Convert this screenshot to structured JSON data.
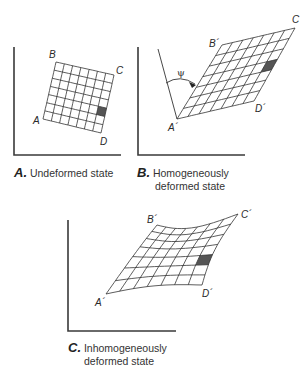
{
  "panels": [
    {
      "id": "A",
      "letter": "A.",
      "caption_line1": "Undeformed state",
      "caption_line2": "",
      "points": {
        "A": "A",
        "B": "B",
        "C": "C",
        "D": "D"
      },
      "grid": {
        "rows": 7,
        "cols": 7,
        "corners": {
          "A": [
            43,
            119
          ],
          "B": [
            56,
            62
          ],
          "C": [
            114,
            75
          ],
          "D": [
            101,
            133
          ]
        },
        "shaded_cell": [
          6,
          2
        ]
      }
    },
    {
      "id": "B",
      "letter": "B.",
      "caption_line1": "Homogeneously",
      "caption_line2": "deformed state",
      "points": {
        "A": "A´",
        "B": "B´",
        "C": "C",
        "D": "D´"
      },
      "angle_label": "ψ",
      "grid": {
        "rows": 7,
        "cols": 7,
        "corners": {
          "A": [
            177,
            119
          ],
          "B": [
            222,
            45
          ],
          "C": [
            295,
            28
          ],
          "D": [
            254,
            101
          ]
        },
        "shaded_cell": [
          6,
          3
        ]
      }
    },
    {
      "id": "C",
      "letter": "C.",
      "caption_line1": "Inhomogeneously",
      "caption_line2": "deformed state",
      "points": {
        "A": "A´",
        "B": "B´",
        "C": "C´",
        "D": "D´"
      },
      "grid": {
        "rows": 7,
        "cols": 7,
        "corners": {
          "A": [
            106,
            294
          ],
          "B": [
            157,
            225
          ],
          "C": [
            238,
            214
          ],
          "D": [
            202,
            285
          ]
        },
        "shaded_cell": [
          6,
          2
        ]
      }
    }
  ],
  "colors": {
    "shade": "#555555",
    "line": "#333333"
  }
}
